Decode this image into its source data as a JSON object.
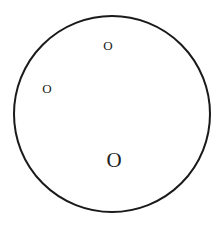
{
  "diagram": {
    "type": "circle-with-labeled-points",
    "shape": "circle",
    "stroke_color": "#1a1a1a",
    "label_color": "#222222",
    "labels": [
      {
        "id": "label-top",
        "text": "O",
        "size": "small"
      },
      {
        "id": "label-left",
        "text": "O",
        "size": "small"
      },
      {
        "id": "label-center",
        "text": "O",
        "size": "large"
      }
    ]
  }
}
